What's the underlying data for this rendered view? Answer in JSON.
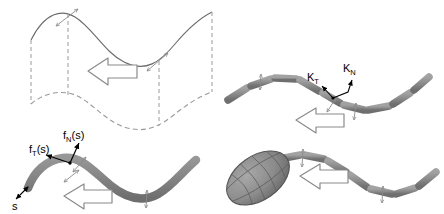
{
  "figure": {
    "title": "",
    "panels": [
      {
        "id": "panel-top-left",
        "name": "continuous-curve-swept-surface",
        "description": "Solid wavy curve above a dashed translated copy, joined by dashed vertical generator lines, with normal-direction tick arrows and a hollow leftward block arrow",
        "labels": [],
        "arrow_direction": "left"
      },
      {
        "id": "panel-top-right",
        "name": "discretized-rod-stiffness",
        "description": "Segmented rod of rounded links with joint tick arrows, labelled tangential and normal spring constants",
        "labels": [
          "K_T",
          "K_N"
        ],
        "arrow_direction": "left"
      },
      {
        "id": "panel-bottom-left",
        "name": "continuous-rod-forces",
        "description": "Smooth thick grey rod with tangential and normal force labels and arclength coordinate s",
        "labels": [
          "f_T(s)",
          "f_N(s)",
          "s"
        ],
        "arrow_direction": "left"
      },
      {
        "id": "panel-bottom-right",
        "name": "rod-with-ellipsoidal-body",
        "description": "Segmented rod attached to a shaded meshed ellipsoid (cell body / head)",
        "labels": [],
        "arrow_direction": "left"
      }
    ]
  },
  "labels": {
    "k_tangential": {
      "base": "K",
      "sub": "T"
    },
    "k_normal": {
      "base": "K",
      "sub": "N"
    },
    "f_tangential": {
      "base": "f",
      "sub": "T",
      "arg": "(s)"
    },
    "f_normal": {
      "base": "f",
      "sub": "N",
      "arg": "(s)"
    },
    "arclength": "s"
  },
  "colors": {
    "background": "#ffffff",
    "rod_fill": "#8f8f8f",
    "rod_fill_dark": "#6f6f6f",
    "rod_stroke": "#5a5a5a",
    "curve_line": "#6b6b6b",
    "dashed_line": "#9a9a9a",
    "tick_arrow": "#8a8a8a",
    "block_arrow_stroke": "#8a8a8a",
    "block_arrow_fill": "#ffffff",
    "label_text": "#000000",
    "ellipse_fill": "#8b8b8b",
    "ellipse_mesh": "#5f5f5f"
  }
}
